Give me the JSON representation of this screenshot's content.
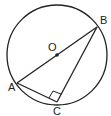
{
  "diagram": {
    "colors": {
      "stroke": "#222222",
      "background": "#ffffff"
    },
    "circle": {
      "center_label": "O",
      "cx": 57,
      "cy": 55,
      "r": 50
    },
    "points": [
      {
        "label": "O",
        "x": 57,
        "y": 55,
        "label_x": 48,
        "label_y": 51
      },
      {
        "label": "B",
        "x": 97,
        "y": 27,
        "label_x": 100,
        "label_y": 24
      },
      {
        "label": "A",
        "x": 17,
        "y": 83,
        "label_x": 8,
        "label_y": 91
      },
      {
        "label": "C",
        "x": 57,
        "y": 102,
        "label_x": 53,
        "label_y": 115
      }
    ],
    "segments": [
      "AB",
      "BC",
      "AC"
    ],
    "right_angle_at": "C"
  }
}
